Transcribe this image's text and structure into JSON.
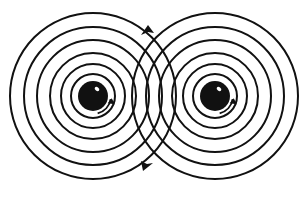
{
  "diagram": {
    "title": "",
    "background": "#ffffff",
    "stroke_color": "#111111",
    "sources": [
      {
        "id": "left",
        "cx": 93,
        "cy": 96,
        "sphere_radius": 15,
        "ring_radii": [
          22,
          32,
          43,
          56,
          69,
          83
        ],
        "spin": "clockwise"
      },
      {
        "id": "right",
        "cx": 215,
        "cy": 96,
        "sphere_radius": 15,
        "ring_radii": [
          22,
          32,
          43,
          56,
          69,
          83
        ],
        "spin": "clockwise"
      }
    ],
    "markers": [
      {
        "id": "top-arrow",
        "x": 147,
        "y": 31,
        "direction": "up"
      },
      {
        "id": "bottom-arrow",
        "x": 147,
        "y": 165,
        "direction": "down"
      }
    ]
  }
}
